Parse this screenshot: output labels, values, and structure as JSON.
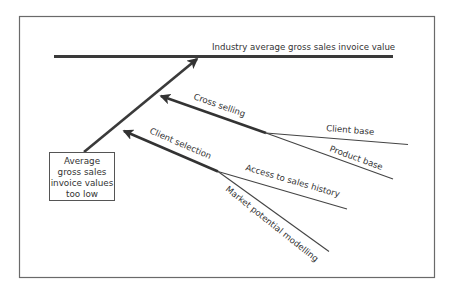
{
  "diagram": {
    "type": "fishbone",
    "effect": {
      "lines": [
        "Average",
        "gross sales",
        "invoice values",
        "too low"
      ]
    },
    "target": {
      "label": "Industry average gross sales invoice value"
    },
    "causes": [
      {
        "label": "Cross selling",
        "sub_causes": [
          {
            "label": "Client base"
          },
          {
            "label": "Product base"
          }
        ]
      },
      {
        "label": "Client selection",
        "sub_causes": [
          {
            "label": "Access to sales history"
          },
          {
            "label": "Market potential modelling"
          }
        ]
      }
    ],
    "colors": {
      "line": "#3a3a3a",
      "text": "#333333",
      "frame": "#6a6a6a",
      "background": "#ffffff"
    }
  }
}
